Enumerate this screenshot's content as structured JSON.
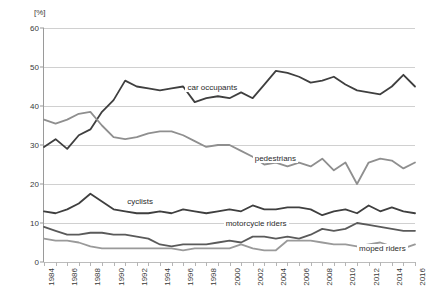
{
  "chart_data": {
    "type": "line",
    "title": "",
    "subtitle": "",
    "xlabel": "",
    "ylabel": "",
    "unit_label": "[%]",
    "grid": true,
    "legend_position": "inline-annotations",
    "ylim": [
      0,
      60
    ],
    "yticks": [
      "0",
      "10",
      "20",
      "30",
      "40",
      "50",
      "60"
    ],
    "xlim": [
      1984,
      2016
    ],
    "x": [
      1984,
      1985,
      1986,
      1987,
      1988,
      1989,
      1990,
      1991,
      1992,
      1993,
      1994,
      1995,
      1996,
      1997,
      1998,
      1999,
      2000,
      2001,
      2002,
      2003,
      2004,
      2005,
      2006,
      2007,
      2008,
      2009,
      2010,
      2011,
      2012,
      2013,
      2014,
      2015,
      2016
    ],
    "xticks": [
      "1984",
      "1986",
      "1988",
      "1990",
      "1992",
      "1994",
      "1996",
      "1998",
      "2000",
      "2002",
      "2004",
      "2006",
      "2008",
      "2010",
      "2012",
      "2014",
      "2016"
    ],
    "series": [
      {
        "name": "car occupants",
        "color": "#3f3f3f",
        "label_x": 1996.2,
        "label_y": 44.5,
        "values": [
          29.5,
          31.5,
          29.0,
          32.5,
          34.0,
          38.5,
          41.5,
          46.5,
          45.0,
          44.5,
          44.0,
          44.5,
          45.0,
          41.0,
          42.0,
          42.5,
          42.0,
          43.5,
          42.0,
          45.5,
          49.0,
          48.5,
          47.5,
          46.0,
          46.5,
          47.5,
          45.5,
          44.0,
          43.5,
          43.0,
          45.0,
          48.0,
          45.0
        ]
      },
      {
        "name": "pedestrians",
        "color": "#8f8f8f",
        "label_x": 2002.0,
        "label_y": 26.5,
        "values": [
          36.5,
          35.5,
          36.5,
          38.0,
          38.5,
          35.0,
          32.0,
          31.5,
          32.0,
          33.0,
          33.5,
          33.5,
          32.5,
          31.0,
          29.5,
          30.0,
          30.0,
          28.5,
          27.0,
          25.0,
          25.5,
          24.5,
          25.5,
          24.5,
          26.5,
          23.5,
          25.5,
          20.0,
          25.5,
          26.5,
          26.0,
          24.0,
          25.5
        ]
      },
      {
        "name": "cyclists",
        "color": "#3f3f3f",
        "label_x": 1991.0,
        "label_y": 15.5,
        "values": [
          13.0,
          12.5,
          13.5,
          15.0,
          17.5,
          15.5,
          13.5,
          13.0,
          12.5,
          12.5,
          13.0,
          12.5,
          13.5,
          13.0,
          12.5,
          13.0,
          13.5,
          13.0,
          14.5,
          13.5,
          13.5,
          14.0,
          14.0,
          13.5,
          12.0,
          13.0,
          13.5,
          12.5,
          14.5,
          13.0,
          14.0,
          13.0,
          12.5
        ]
      },
      {
        "name": "motorcycle riders",
        "color": "#5a5a5a",
        "label_x": 1999.5,
        "label_y": 9.8,
        "values": [
          9.0,
          8.0,
          7.0,
          7.0,
          7.5,
          7.5,
          7.0,
          7.0,
          6.5,
          6.0,
          4.5,
          4.0,
          4.5,
          4.5,
          4.5,
          5.0,
          5.5,
          5.0,
          6.5,
          6.5,
          6.0,
          6.5,
          6.0,
          7.0,
          8.5,
          8.0,
          8.5,
          10.0,
          9.5,
          9.0,
          8.5,
          8.0,
          8.0
        ]
      },
      {
        "name": "moped riders",
        "color": "#9a9a9a",
        "label_x": 2011.0,
        "label_y": 3.4,
        "values": [
          6.0,
          5.5,
          5.5,
          5.0,
          4.0,
          3.5,
          3.5,
          3.5,
          3.5,
          3.5,
          3.5,
          3.5,
          3.0,
          3.5,
          3.5,
          3.5,
          3.5,
          4.5,
          3.5,
          3.0,
          3.0,
          5.5,
          5.5,
          5.5,
          5.0,
          4.5,
          4.5,
          4.0,
          4.5,
          5.0,
          4.0,
          3.5,
          4.5
        ]
      }
    ]
  }
}
